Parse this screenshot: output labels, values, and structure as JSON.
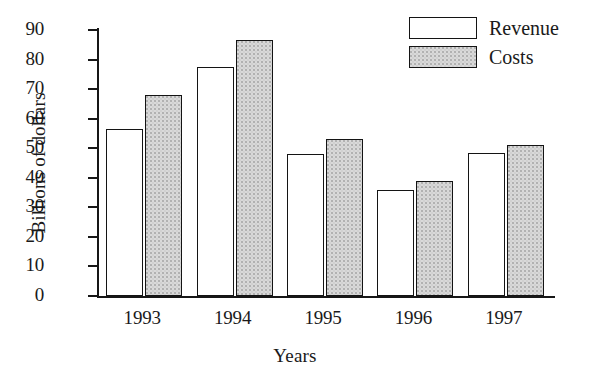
{
  "chart_data": {
    "type": "bar",
    "title": "",
    "subtitle": "",
    "xlabel": "Years",
    "ylabel": "Billions of dollars",
    "categories": [
      "1993",
      "1994",
      "1995",
      "1996",
      "1997"
    ],
    "series": [
      {
        "name": "Revenue",
        "values": [
          56.5,
          77.5,
          48,
          36,
          48.5
        ],
        "fill": "#ffffff"
      },
      {
        "name": "Costs",
        "values": [
          68,
          86.5,
          53,
          39,
          51
        ],
        "fill": "#d9d9d9"
      }
    ],
    "ylim": [
      0,
      90
    ],
    "ytick_labels": [
      "0",
      "10",
      "20",
      "30",
      "40",
      "50",
      "60",
      "70",
      "80",
      "90"
    ],
    "ytick_values": [
      0,
      10,
      20,
      30,
      40,
      50,
      60,
      70,
      80,
      90
    ],
    "grid": false,
    "legend_position": "top-right",
    "legend_entries": [
      "Revenue",
      "Costs"
    ],
    "axis_color": "#171717",
    "bar_border_color": "#141414",
    "background": "#ffffff"
  }
}
